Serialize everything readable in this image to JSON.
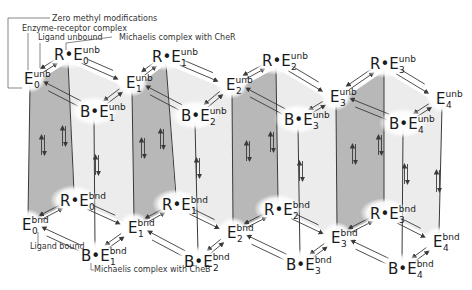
{
  "colors": {
    "shaded_face": "#b8b8b8",
    "light_face": "#ececec",
    "edge": "#3a3a3a",
    "halo": "#ffffff",
    "text": "#1a1a1a"
  },
  "annotations": [
    {
      "id": "zero-methyl",
      "text": "Zero methyl modifications",
      "x": 52,
      "y": 21,
      "line": [
        [
          50,
          18
        ],
        [
          8,
          18
        ],
        [
          8,
          88
        ],
        [
          22,
          88
        ]
      ]
    },
    {
      "id": "enzyme-receptor",
      "text": "Enzyme-receptor complex",
      "x": 22,
      "y": 31,
      "line": [
        [
          28,
          33
        ],
        [
          28,
          70
        ]
      ]
    },
    {
      "id": "ligand-unbound",
      "text": "Ligand unbound",
      "x": 38,
      "y": 40,
      "line": [
        [
          40,
          43
        ],
        [
          40,
          68
        ]
      ]
    },
    {
      "id": "michaelis-cher",
      "text": "Michaelis complex with CheR",
      "x": 119,
      "y": 40,
      "line": [
        [
          112,
          37
        ],
        [
          66,
          43
        ],
        [
          66,
          50
        ]
      ]
    },
    {
      "id": "ligand-bound",
      "text": "Ligand bound",
      "x": 30,
      "y": 249,
      "line": [
        [
          38,
          232
        ],
        [
          38,
          246
        ]
      ]
    },
    {
      "id": "michaelis-cheb",
      "text": "Michaelis complex with CheB",
      "x": 94,
      "y": 272,
      "line": [
        [
          91,
          263
        ],
        [
          91,
          270
        ],
        [
          94,
          270
        ]
      ]
    }
  ],
  "nodes": {
    "unb": [
      {
        "id": "E0u",
        "prefix": "",
        "sub": "0",
        "sup": "unb",
        "x": 24,
        "y": 84
      },
      {
        "id": "RE0u",
        "prefix": "R•",
        "sub": "0",
        "sup": "unb",
        "x": 54,
        "y": 60
      },
      {
        "id": "E1u",
        "prefix": "",
        "sub": "1",
        "sup": "unb",
        "x": 126,
        "y": 88
      },
      {
        "id": "BE1u",
        "prefix": "B•",
        "sub": "1",
        "sup": "unb",
        "x": 80,
        "y": 117
      },
      {
        "id": "RE1u",
        "prefix": "R•",
        "sub": "1",
        "sup": "unb",
        "x": 152,
        "y": 62
      },
      {
        "id": "E2u",
        "prefix": "",
        "sub": "2",
        "sup": "unb",
        "x": 226,
        "y": 90
      },
      {
        "id": "BE2u",
        "prefix": "B•",
        "sub": "2",
        "sup": "unb",
        "x": 181,
        "y": 121
      },
      {
        "id": "RE2u",
        "prefix": "R•",
        "sub": "2",
        "sup": "unb",
        "x": 262,
        "y": 66
      },
      {
        "id": "E3u",
        "prefix": "",
        "sub": "3",
        "sup": "unb",
        "x": 330,
        "y": 102
      },
      {
        "id": "BE3u",
        "prefix": "B•",
        "sub": "3",
        "sup": "unb",
        "x": 284,
        "y": 125
      },
      {
        "id": "RE3u",
        "prefix": "R•",
        "sub": "3",
        "sup": "unb",
        "x": 370,
        "y": 69
      },
      {
        "id": "E4u",
        "prefix": "",
        "sub": "4",
        "sup": "unb",
        "x": 436,
        "y": 104
      },
      {
        "id": "BE4u",
        "prefix": "B•",
        "sub": "4",
        "sup": "unb",
        "x": 389,
        "y": 129
      }
    ],
    "bnd": [
      {
        "id": "E0b",
        "prefix": "",
        "sub": "0",
        "sup": "bnd",
        "x": 22,
        "y": 230
      },
      {
        "id": "RE0b",
        "prefix": "R•",
        "sub": "0",
        "sup": "bnd",
        "x": 60,
        "y": 206
      },
      {
        "id": "E1b",
        "prefix": "",
        "sub": "1",
        "sup": "bnd",
        "x": 128,
        "y": 233
      },
      {
        "id": "BE1b",
        "prefix": "B•",
        "sub": "1",
        "sup": "bnd",
        "x": 81,
        "y": 261
      },
      {
        "id": "RE1b",
        "prefix": "R•",
        "sub": "1",
        "sup": "bnd",
        "x": 162,
        "y": 210
      },
      {
        "id": "E2b",
        "prefix": "",
        "sub": "2",
        "sup": "bnd",
        "x": 227,
        "y": 238
      },
      {
        "id": "BE2b",
        "prefix": "B•",
        "sub": "2",
        "sup": "bnd",
        "x": 184,
        "y": 267
      },
      {
        "id": "RE2b",
        "prefix": "R•",
        "sub": "2",
        "sup": "bnd",
        "x": 264,
        "y": 215
      },
      {
        "id": "E3b",
        "prefix": "",
        "sub": "3",
        "sup": "bnd",
        "x": 331,
        "y": 243
      },
      {
        "id": "BE3b",
        "prefix": "B•",
        "sub": "3",
        "sup": "bnd",
        "x": 286,
        "y": 270
      },
      {
        "id": "RE3b",
        "prefix": "R•",
        "sub": "3",
        "sup": "bnd",
        "x": 370,
        "y": 219
      },
      {
        "id": "E4b",
        "prefix": "",
        "sub": "4",
        "sup": "bnd",
        "x": 433,
        "y": 247
      },
      {
        "id": "BE4b",
        "prefix": "B•",
        "sub": "4",
        "sup": "bnd",
        "x": 388,
        "y": 274
      }
    ]
  },
  "columns_x": {
    "E": [
      30,
      130,
      232,
      335,
      440
    ],
    "R": [
      72,
      170,
      275,
      385
    ],
    "B": [
      93,
      192,
      293,
      394
    ]
  }
}
